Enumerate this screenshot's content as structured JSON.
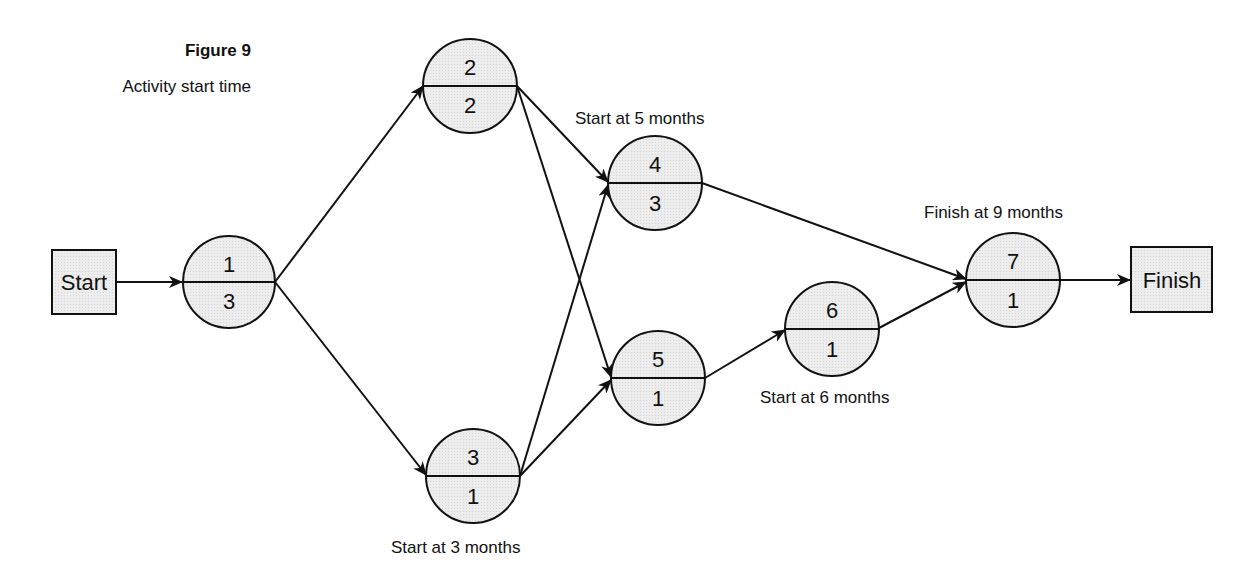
{
  "figure": {
    "title": "Figure 9",
    "subtitle": "Activity start time"
  },
  "colors": {
    "node_fill": "#ebebeb",
    "stroke": "#111111",
    "background": "#ffffff"
  },
  "terminals": {
    "start": {
      "label": "Start"
    },
    "finish": {
      "label": "Finish"
    }
  },
  "nodes": [
    {
      "id": "1",
      "activity": "1",
      "duration": "3"
    },
    {
      "id": "2",
      "activity": "2",
      "duration": "2"
    },
    {
      "id": "3",
      "activity": "3",
      "duration": "1"
    },
    {
      "id": "4",
      "activity": "4",
      "duration": "3"
    },
    {
      "id": "5",
      "activity": "5",
      "duration": "1"
    },
    {
      "id": "6",
      "activity": "6",
      "duration": "1"
    },
    {
      "id": "7",
      "activity": "7",
      "duration": "1"
    }
  ],
  "annotations": {
    "node4": "Start at 5 months",
    "node3": "Start at 3 months",
    "node6": "Start at 6 months",
    "node7": "Finish at 9 months"
  },
  "edges": [
    {
      "from": "Start",
      "to": "1"
    },
    {
      "from": "1",
      "to": "2"
    },
    {
      "from": "1",
      "to": "3"
    },
    {
      "from": "2",
      "to": "4"
    },
    {
      "from": "2",
      "to": "5"
    },
    {
      "from": "3",
      "to": "4"
    },
    {
      "from": "3",
      "to": "5"
    },
    {
      "from": "4",
      "to": "7"
    },
    {
      "from": "5",
      "to": "6"
    },
    {
      "from": "6",
      "to": "7"
    },
    {
      "from": "7",
      "to": "Finish"
    }
  ]
}
